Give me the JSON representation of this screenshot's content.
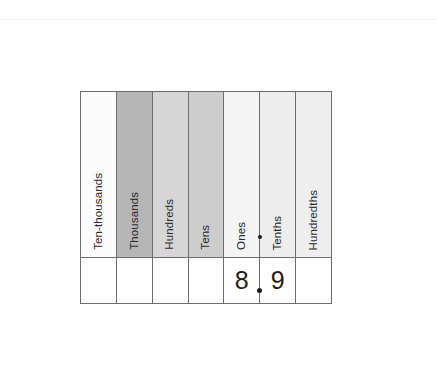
{
  "chart_data": {
    "type": "table",
    "columns": [
      {
        "label": "Ten-thousands",
        "shade": "#fbfbfb",
        "value": ""
      },
      {
        "label": "Thousands",
        "shade": "#b6b6b6",
        "value": ""
      },
      {
        "label": "Hundreds",
        "shade": "#d6d6d6",
        "value": ""
      },
      {
        "label": "Tens",
        "shade": "#cdcdcd",
        "value": ""
      },
      {
        "label": "Ones",
        "shade": "#f4f4f4",
        "value": "8"
      },
      {
        "label": "Tenths",
        "shade": "#ededed",
        "value": "9"
      },
      {
        "label": "Hundredths",
        "shade": "#eeeeee",
        "value": ""
      }
    ],
    "decimal_point": {
      "symbol": ".",
      "after_column": "Ones",
      "before_column": "Tenths"
    },
    "number_shown": "8.9",
    "grid": true,
    "legend": "none"
  },
  "table": {
    "headers": [
      "Ten-thousands",
      "Thousands",
      "Hundreds",
      "Tens",
      "Ones",
      "Tenths",
      "Hundredths"
    ],
    "values": [
      "",
      "",
      "",
      "",
      "8",
      "9",
      ""
    ]
  },
  "colors": {
    "border": "#6d6d6d",
    "text": "#2b2b2b",
    "digit": "#1d1d1d",
    "page_background": "#ffffff",
    "rule": "#f2f3f5"
  }
}
